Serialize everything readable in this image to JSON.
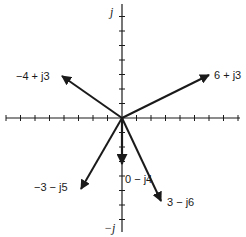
{
  "diagram": {
    "colors": {
      "ink": "#1a1a1a",
      "background": "#ffffff"
    },
    "axes": {
      "imag_pos_label": "j",
      "imag_neg_label": "−j",
      "real_ticks_each_side": 8,
      "imag_ticks_up": 7,
      "imag_ticks_down": 7
    },
    "vectors": [
      {
        "label": "−4 + j3",
        "re": -4,
        "im": 3
      },
      {
        "label": "6 + j3",
        "re": 6,
        "im": 3
      },
      {
        "label": "−3 − j5",
        "re": -3,
        "im": -5
      },
      {
        "label": "0 − j4",
        "re": 0,
        "im": -4
      },
      {
        "label": "3 − j6",
        "re": 3,
        "im": -6
      }
    ]
  }
}
